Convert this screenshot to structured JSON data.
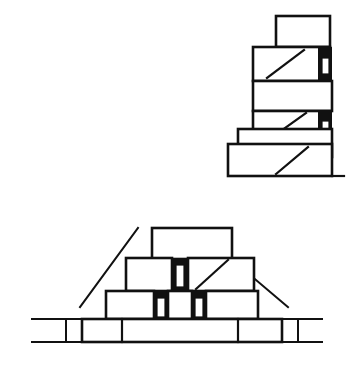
{
  "document": {
    "title": "Masonry Construction Line Drawing",
    "background_color": "#ffffff",
    "ink_color": "#111111",
    "width": 364,
    "height": 365,
    "style": "black-and-white technical line drawing, no text labels"
  },
  "figures": [
    {
      "id": "upper-figure",
      "name": "stepped-wall-corner-elevation",
      "description": "Stepped masonry wall corner built of rectangular stone blocks rising to the right, with diagonal tooling lines and black mortar joints containing white slots on the right face.",
      "position": {
        "x": 230,
        "y": 14,
        "width": 110,
        "height": 165
      },
      "course_count": 6,
      "black_joint_count": 2,
      "white_slot_count": 2,
      "diagonal_count": 3
    },
    {
      "id": "lower-figure",
      "name": "stepped-pyramid-terrace-section",
      "description": "Trapezoidal stepped pyramid / terrace cross-section of four receding courses of stone blocks, with sloping batter lines on both flanks, black vertical mortar joints holding white slots, and ground lines extending left and right from the base.",
      "position": {
        "x": 30,
        "y": 226,
        "width": 292,
        "height": 110
      },
      "course_count": 4,
      "black_joint_count": 3,
      "white_slot_count": 3,
      "diagonal_count": 1,
      "symmetry": "bilateral"
    }
  ],
  "legend": {
    "white_block_label": "dressed stone block",
    "black_joint_label": "filled mortar joint",
    "slot_label": "recessed slot",
    "diagonal_label": "tooled diagonal face",
    "ground_line_label": "ground line"
  }
}
